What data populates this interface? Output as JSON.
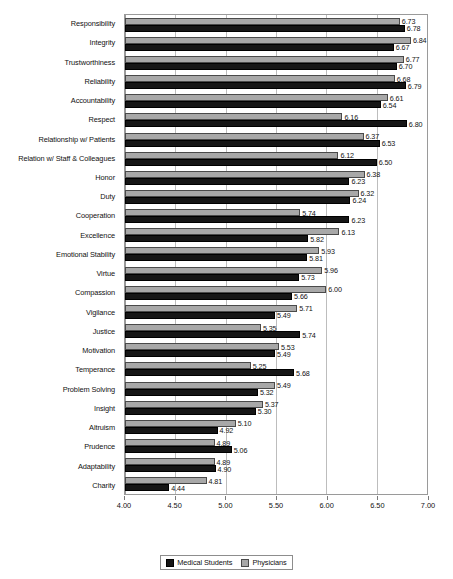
{
  "chart_data": {
    "type": "bar",
    "orientation": "horizontal",
    "title": "",
    "xlabel": "",
    "ylabel": "",
    "xlim": [
      4.0,
      7.0
    ],
    "xticks": [
      "4.00",
      "4.50",
      "5.00",
      "5.50",
      "6.00",
      "6.50",
      "7.00"
    ],
    "xtick_values": [
      4.0,
      4.5,
      5.0,
      5.5,
      6.0,
      6.5,
      7.0
    ],
    "grid": true,
    "legend_position": "bottom-center",
    "categories": [
      "Responsibility",
      "Integrity",
      "Trustworthiness",
      "Reliability",
      "Accountability",
      "Respect",
      "Relationship w/ Patients",
      "Relation w/ Staff & Colleagues",
      "Honor",
      "Duty",
      "Cooperation",
      "Excellence",
      "Emotional Stability",
      "Virtue",
      "Compassion",
      "Vigilance",
      "Justice",
      "Motivation",
      "Temperance",
      "Problem Solving",
      "Insight",
      "Altruism",
      "Prudence",
      "Adaptability",
      "Charity"
    ],
    "series": [
      {
        "name": "Physicians",
        "color": "#a8a8a8",
        "values": [
          6.73,
          6.84,
          6.77,
          6.68,
          6.61,
          6.16,
          6.37,
          6.12,
          6.38,
          6.32,
          5.74,
          6.13,
          5.93,
          5.96,
          6.0,
          5.71,
          5.35,
          5.53,
          5.25,
          5.49,
          5.37,
          5.1,
          4.89,
          4.89,
          4.81
        ],
        "labels": [
          "6.73",
          "6.84",
          "6.77",
          "6.68",
          "6.61",
          "6.16",
          "6.37",
          "6.12",
          "6.38",
          "6.32",
          "5.74",
          "6.13",
          "5.93",
          "5.96",
          "6.00",
          "5.71",
          "5.35",
          "5.53",
          "5.25",
          "5.49",
          "5.37",
          "5.10",
          "4.89",
          "4.89",
          "4.81"
        ]
      },
      {
        "name": "Medical Students",
        "color": "#161616",
        "values": [
          6.78,
          6.67,
          6.7,
          6.79,
          6.54,
          6.8,
          6.53,
          6.5,
          6.23,
          6.24,
          6.23,
          5.82,
          5.81,
          5.73,
          5.66,
          5.49,
          5.74,
          5.49,
          5.68,
          5.32,
          5.3,
          4.92,
          5.06,
          4.9,
          4.44
        ],
        "labels": [
          "6.78",
          "6.67",
          "6.70",
          "6.79",
          "6.54",
          "6.80",
          "6.53",
          "6.50",
          "6.23",
          "6.24",
          "6.23",
          "5.82",
          "5.81",
          "5.73",
          "5.66",
          "5.49",
          "5.74",
          "5.49",
          "5.68",
          "5.32",
          "5.30",
          "4.92",
          "5.06",
          "4.90",
          "4.44"
        ]
      }
    ]
  },
  "legend": {
    "items": [
      {
        "label": "Medical Students",
        "swatch": "black-square-icon"
      },
      {
        "label": "Physicians",
        "swatch": "gray-square-icon"
      }
    ]
  }
}
